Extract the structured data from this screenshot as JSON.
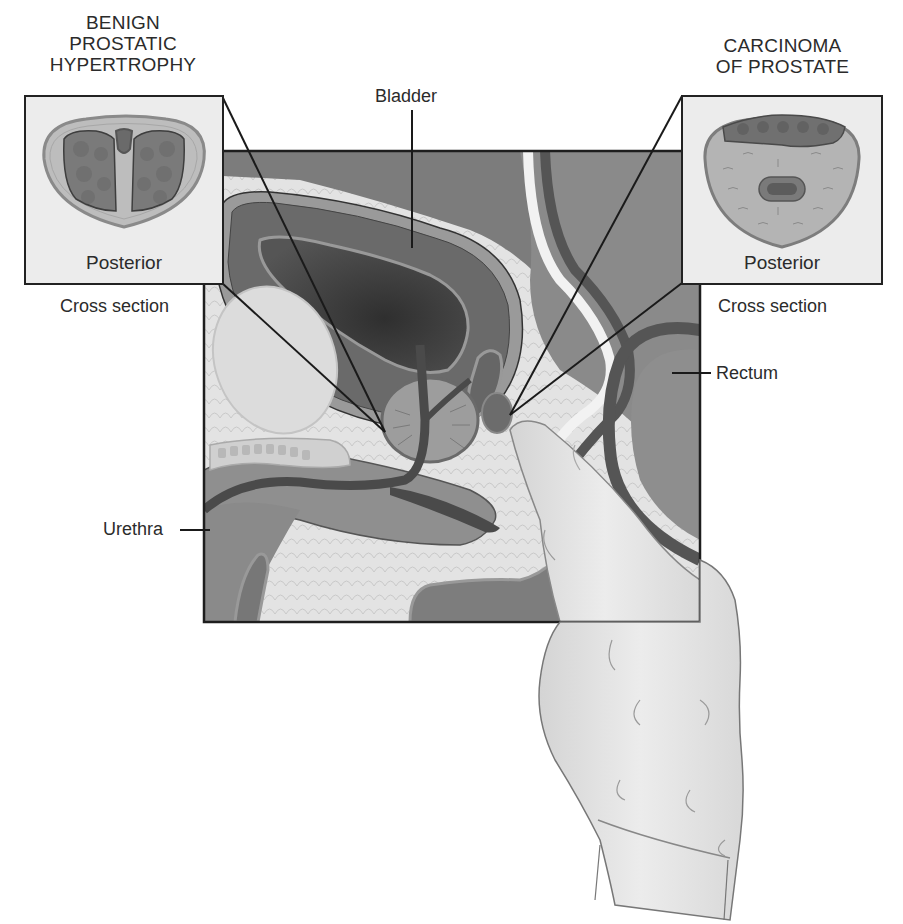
{
  "figure": {
    "colors": {
      "outline": "#222222",
      "tissue_dark": "#4a4a4a",
      "tissue_mid": "#7a7a7a",
      "tissue_light": "#a8a8a8",
      "fat_background": "#e2e2e2",
      "glove": "#e6e6e6",
      "inset_background": "#ececec"
    }
  },
  "insets": {
    "left": {
      "title_lines": [
        "BENIGN",
        "PROSTATIC",
        "HYPERTROPHY"
      ],
      "inner_label": "Posterior",
      "caption": "Cross section"
    },
    "right": {
      "title_lines": [
        "CARCINOMA",
        "OF PROSTATE"
      ],
      "inner_label": "Posterior",
      "caption": "Cross section"
    }
  },
  "labels": {
    "bladder": "Bladder",
    "rectum": "Rectum",
    "urethra": "Urethra"
  }
}
